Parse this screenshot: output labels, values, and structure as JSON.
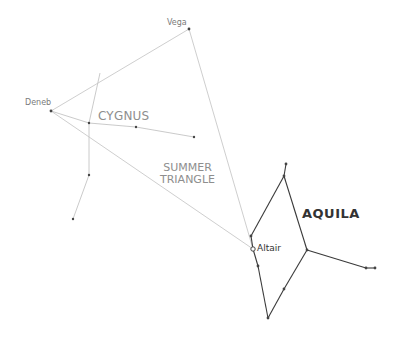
{
  "labels": {
    "vega": "Vega",
    "deneb": "Deneb",
    "altair": "Altair",
    "cygnus": "CYGNUS",
    "summer_triangle_line1": "SUMMER",
    "summer_triangle_line2": "TRIANGLE",
    "aquila": "AQUILA"
  },
  "colors": {
    "background": "#ffffff",
    "triangle_line": "#c8c8c8",
    "cygnus_line": "#c4c4c4",
    "aquila_line": "#3a3a3a",
    "star": "#444444",
    "faint_label": "#8e8e8e",
    "bold_label": "#333333"
  },
  "stars": {
    "vega": [
      189,
      29
    ],
    "deneb": [
      51,
      111
    ],
    "altair": [
      253,
      249
    ]
  },
  "summer_triangle": [
    [
      51,
      111
    ],
    [
      189,
      29
    ],
    [
      253,
      249
    ]
  ],
  "cygnus": {
    "segments": [
      [
        [
          100,
          73
        ],
        [
          89,
          123
        ]
      ],
      [
        [
          89,
          123
        ],
        [
          89,
          175
        ]
      ],
      [
        [
          89,
          175
        ],
        [
          73,
          219
        ]
      ],
      [
        [
          51,
          111
        ],
        [
          89,
          123
        ]
      ],
      [
        [
          89,
          123
        ],
        [
          136,
          127
        ]
      ],
      [
        [
          136,
          127
        ],
        [
          194,
          137
        ]
      ]
    ],
    "points": [
      [
        89,
        123
      ],
      [
        136,
        127
      ],
      [
        194,
        137
      ],
      [
        89,
        175
      ],
      [
        73,
        219
      ]
    ]
  },
  "aquila": {
    "segments": [
      [
        [
          286,
          164
        ],
        [
          284,
          176
        ]
      ],
      [
        [
          284,
          176
        ],
        [
          251,
          236
        ]
      ],
      [
        [
          251,
          236
        ],
        [
          253,
          249
        ]
      ],
      [
        [
          253,
          249
        ],
        [
          258,
          266
        ]
      ],
      [
        [
          258,
          266
        ],
        [
          268,
          318
        ]
      ],
      [
        [
          268,
          318
        ],
        [
          284,
          289
        ]
      ],
      [
        [
          284,
          289
        ],
        [
          307,
          250
        ]
      ],
      [
        [
          307,
          250
        ],
        [
          284,
          176
        ]
      ],
      [
        [
          307,
          250
        ],
        [
          366,
          268
        ]
      ],
      [
        [
          366,
          268
        ],
        [
          375,
          268
        ]
      ]
    ],
    "points": [
      [
        286,
        164
      ],
      [
        284,
        176
      ],
      [
        251,
        236
      ],
      [
        258,
        266
      ],
      [
        268,
        318
      ],
      [
        284,
        289
      ],
      [
        307,
        250
      ],
      [
        366,
        268
      ],
      [
        375,
        268
      ]
    ]
  }
}
